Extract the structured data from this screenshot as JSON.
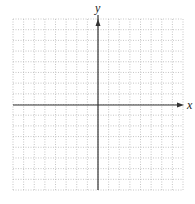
{
  "diagram": {
    "type": "coordinate-plane",
    "x_axis_label": "x",
    "y_axis_label": "y",
    "grid": {
      "columns": 16,
      "rows": 16,
      "left": 13,
      "top": 19,
      "right": 183,
      "bottom": 190,
      "line_style": "dotted",
      "line_color": "#b8b8b8"
    },
    "axes": {
      "origin_x": 98,
      "origin_y": 105,
      "color": "#333333",
      "x_arrow_end": 184,
      "y_arrow_end": 10
    }
  }
}
